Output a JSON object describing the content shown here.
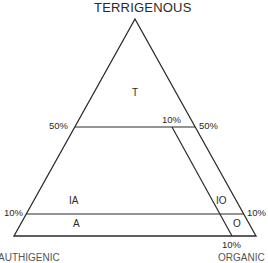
{
  "diagram": {
    "title": "TERRIGENOUS",
    "type": "ternary classification triangle",
    "line_color": "#2a2a2a",
    "corners": {
      "top": "TERRIGENOUS",
      "bottom_left": "AUTHIGENIC",
      "bottom_right": "ORGANIC"
    },
    "fields": [
      {
        "id": "T",
        "label": "T"
      },
      {
        "id": "IA",
        "label": "IA"
      },
      {
        "id": "A",
        "label": "A"
      },
      {
        "id": "IO",
        "label": "IO"
      },
      {
        "id": "O",
        "label": "O"
      }
    ],
    "boundary_labels": {
      "left_50": "50%",
      "right_50": "50%",
      "inner_10_top": "10%",
      "left_10": "10%",
      "right_10": "10%",
      "bottom_10": "10%"
    }
  }
}
